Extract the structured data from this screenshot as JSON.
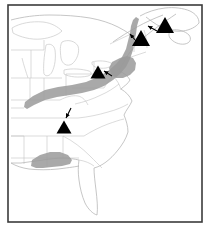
{
  "figure": {
    "kind": "distribution-map",
    "region": "Eastern United States",
    "width": 210,
    "height": 233,
    "background_color": "#ffffff"
  },
  "frame": {
    "name": "map-border",
    "stroke_color": "#3b3b3b",
    "stroke_width": 1.6,
    "x": 8,
    "y": 5,
    "width": 194,
    "height": 217
  },
  "style": {
    "coastline_color": "#b3b3b3",
    "state_border_color": "#c2c2c2",
    "lake_color": "#c8c8c8",
    "shaded_range_fill": "#9a9a9a",
    "shaded_range_opacity": 0.85,
    "marker_fill": "#000000",
    "arrow_color": "#000000"
  },
  "legend_text": "",
  "shaded_ranges": [
    {
      "name": "appalachian-range-band",
      "label": "Appalachian shaded band",
      "fill": "#9a9a9a",
      "points": "25,102 33,96 45,90 58,87 72,85 86,82 98,77 108,71 116,64 122,57 126,49 128,41 130,33 131,26 133,20 136,17 139,19 137,26 136,34 134,42 133,50 130,59 126,67 120,74 113,80 104,86 94,90 82,93 70,95 57,97 45,100 34,105 27,109 24,107"
    },
    {
      "name": "hudson-valley-widening",
      "label": "Hudson valley widened lobe",
      "fill": "#9a9a9a",
      "points": "112,62 120,58 127,56 133,58 136,63 135,70 130,75 123,78 116,78 111,74 109,68"
    },
    {
      "name": "gulf-coastal-range-patch",
      "label": "Mississippi-Alabama shaded patch",
      "fill": "#9a9a9a",
      "points": "32,160 40,155 50,152 60,152 68,155 72,160 70,164 62,166 52,167 43,168 36,168 31,166"
    }
  ],
  "markers": [
    {
      "name": "sample-site-marker-1",
      "label": "Northeastern Maine site",
      "shape": "triangle",
      "cx": 165,
      "cy": 25,
      "size": 18
    },
    {
      "name": "sample-site-marker-2",
      "label": "Vermont / New Hampshire site",
      "shape": "triangle",
      "cx": 141,
      "cy": 38,
      "size": 18
    },
    {
      "name": "sample-site-marker-3",
      "label": "Central New York site",
      "shape": "triangle",
      "cx": 98,
      "cy": 72,
      "size": 15
    },
    {
      "name": "sample-site-marker-4",
      "label": "Tennessee / Kentucky site",
      "shape": "triangle",
      "cx": 64,
      "cy": 127,
      "size": 15
    }
  ],
  "leader_arrows": [
    {
      "name": "leader-arrow-maine",
      "from_x": 157,
      "from_y": 31,
      "to_x": 148,
      "to_y": 26
    },
    {
      "name": "leader-arrow-vermont",
      "from_x": 136,
      "from_y": 41,
      "to_x": 130,
      "to_y": 34
    },
    {
      "name": "leader-arrow-newyork",
      "from_x": 112,
      "from_y": 76,
      "to_x": 104,
      "to_y": 71
    },
    {
      "name": "leader-arrow-tennessee",
      "from_x": 71,
      "from_y": 108,
      "to_x": 66,
      "to_y": 118
    }
  ]
}
